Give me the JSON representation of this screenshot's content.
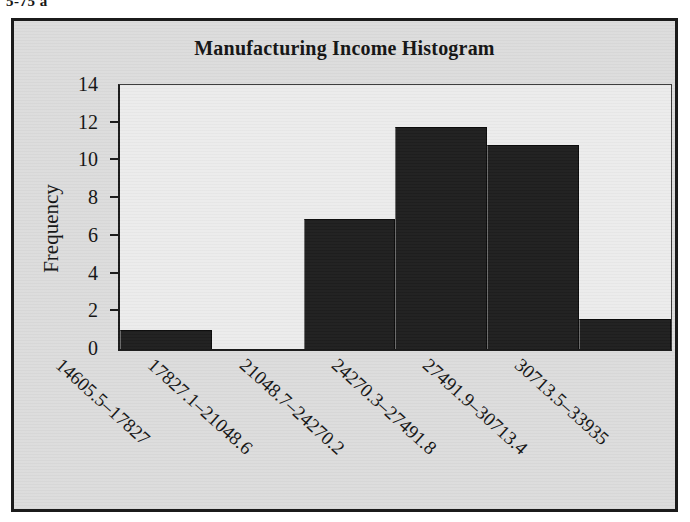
{
  "caption": "5-75 a",
  "chart_data": {
    "type": "bar",
    "title": "Manufacturing Income Histogram",
    "xlabel": "",
    "ylabel": "Frequency",
    "ylim": [
      0,
      14
    ],
    "y_ticks": [
      "0",
      "2",
      "4",
      "6",
      "8",
      "10",
      "12",
      "14"
    ],
    "grid": false,
    "legend": "none",
    "categories": [
      "14605.5–17827",
      "17827.1–21048.6",
      "21048.7–24270.2",
      "24270.3–27491.8",
      "27491.9–30713.4",
      "30713.5–33935"
    ],
    "values": [
      1.0,
      0.0,
      6.9,
      11.8,
      10.8,
      1.6
    ],
    "bar_color": "#1f1f1f",
    "plot_background": "#ececec",
    "figure_background": "#dcdcdc"
  }
}
